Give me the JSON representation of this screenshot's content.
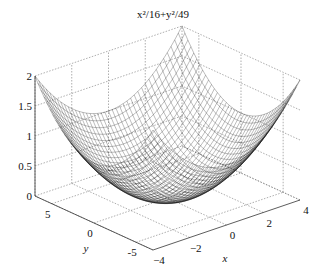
{
  "chart_data": {
    "type": "surface-mesh",
    "title": "x²/16+y²/49",
    "function": "z = x^2/16 + y^2/49",
    "xlabel": "x",
    "ylabel": "y",
    "zlabel": "",
    "xlim": [
      -4,
      4
    ],
    "ylim": [
      -7,
      7
    ],
    "zlim": [
      0,
      2
    ],
    "x_ticks": [
      "-4",
      "-2",
      "0",
      "2",
      "4"
    ],
    "y_ticks": [
      "-5",
      "0",
      "5"
    ],
    "z_ticks": [
      "0",
      "0.5",
      "1",
      "1.5",
      "2"
    ],
    "grid": true,
    "mesh_color": "#000000",
    "sample_values": [
      {
        "x": -4,
        "y": -7,
        "z": 2
      },
      {
        "x": 4,
        "y": 7,
        "z": 2
      },
      {
        "x": -4,
        "y": 7,
        "z": 2
      },
      {
        "x": 4,
        "y": -7,
        "z": 2
      },
      {
        "x": 0,
        "y": 0,
        "z": 0
      },
      {
        "x": 4,
        "y": 0,
        "z": 1
      },
      {
        "x": 0,
        "y": 7,
        "z": 1
      }
    ]
  }
}
